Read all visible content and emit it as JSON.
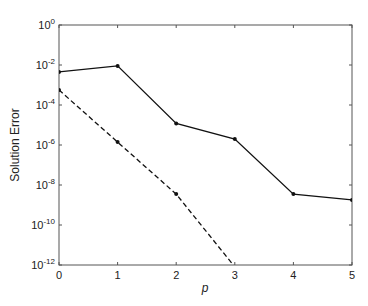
{
  "chart_data": {
    "type": "line",
    "title": "",
    "xlabel": "p",
    "ylabel": "Solution Error",
    "yscale": "log",
    "xlim": [
      0,
      5
    ],
    "ylim": [
      1e-12,
      1
    ],
    "grid": false,
    "legend": null,
    "x_ticks": [
      "0",
      "1",
      "2",
      "3",
      "4",
      "5"
    ],
    "y_ticks": [
      {
        "base": "10",
        "exp": "0",
        "value": 1
      },
      {
        "base": "10",
        "exp": "-2",
        "value": 0.01
      },
      {
        "base": "10",
        "exp": "-4",
        "value": 0.0001
      },
      {
        "base": "10",
        "exp": "-6",
        "value": 1e-06
      },
      {
        "base": "10",
        "exp": "-8",
        "value": 1e-08
      },
      {
        "base": "10",
        "exp": "-10",
        "value": 1e-10
      },
      {
        "base": "10",
        "exp": "-12",
        "value": 1e-12
      }
    ],
    "x": [
      0,
      1,
      2,
      3,
      4,
      5
    ],
    "series": [
      {
        "name": "solid",
        "style": "solid",
        "color": "#111111",
        "x": [
          0,
          1,
          2,
          3,
          4,
          5
        ],
        "values": [
          0.0045,
          0.009,
          1.2e-05,
          2e-06,
          3.5e-09,
          1.8e-09
        ]
      },
      {
        "name": "dashed",
        "style": "dashed",
        "color": "#111111",
        "x": [
          0,
          1,
          2,
          3
        ],
        "values": [
          0.00056,
          1.4e-06,
          3.5e-09,
          8e-13
        ]
      }
    ]
  }
}
